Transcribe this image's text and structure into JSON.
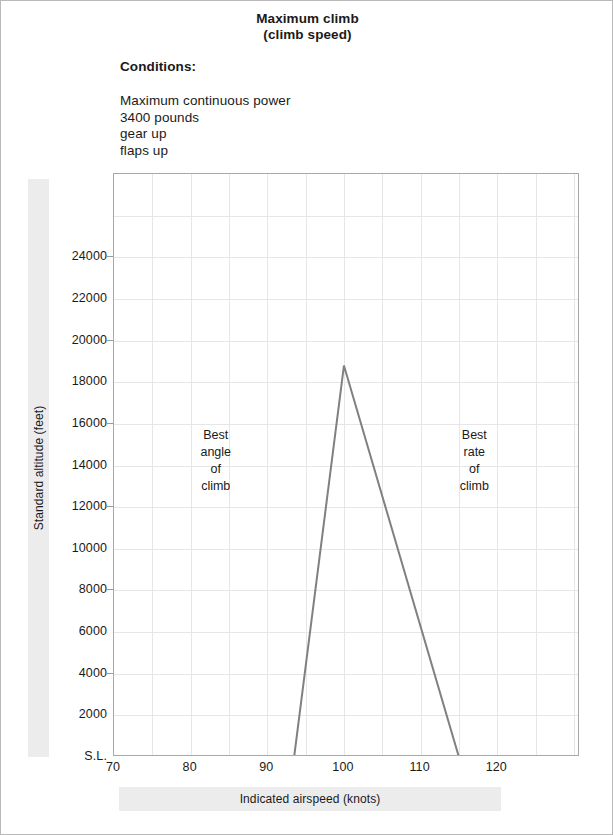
{
  "header": {
    "title_line1": "Maximum climb",
    "title_line2": "(climb speed)",
    "conditions_heading": "Conditions:",
    "conditions": [
      "Maximum continuous power",
      "3400 pounds",
      "gear up",
      "flaps up"
    ]
  },
  "chart_data": {
    "type": "line",
    "title": "Maximum climb (climb speed)",
    "xlabel": "Indicated airspeed (knots)",
    "ylabel": "Standard altitude (feet)",
    "xlim": [
      70,
      130.8
    ],
    "ylim": [
      0,
      28000
    ],
    "grid": true,
    "legend": "none",
    "xticks": [
      70,
      80,
      90,
      100,
      110,
      120
    ],
    "xticklabels": [
      "70",
      "80",
      "90",
      "100",
      "110",
      "120"
    ],
    "yticks": [
      0,
      2000,
      4000,
      6000,
      8000,
      10000,
      12000,
      14000,
      16000,
      18000,
      20000,
      22000,
      24000
    ],
    "yticklabels": [
      "S.L.",
      "2000",
      "4000",
      "6000",
      "8000",
      "10000",
      "12000",
      "14000",
      "16000",
      "18000",
      "20000",
      "22000",
      "24000"
    ],
    "x_gridline_step": 5,
    "y_gridline_step": 2000,
    "series": [
      {
        "name": "climb speed envelope",
        "color": "#808080",
        "linewidth": 2,
        "x": [
          93.5,
          100.0,
          115.0
        ],
        "y": [
          0,
          18800,
          0
        ]
      }
    ],
    "annotations": [
      {
        "name": "best-angle-of-climb",
        "lines": [
          "Best",
          "angle",
          "of",
          "climb"
        ],
        "x": 83.3,
        "y": 14200
      },
      {
        "name": "best-rate-of-climb",
        "lines": [
          "Best",
          "rate",
          "of",
          "climb"
        ],
        "x": 117.0,
        "y": 14200
      }
    ]
  }
}
